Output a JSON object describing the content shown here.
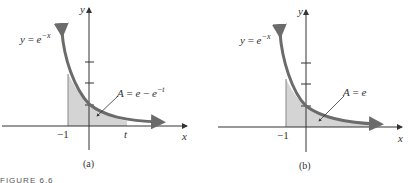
{
  "figure_caption": "FIGURE 6.6",
  "panels": [
    {
      "id": "a",
      "caption": "(a)",
      "function_label": {
        "lhs": "y",
        "eq": "=",
        "base": "e",
        "exp": "−x"
      },
      "area_label": {
        "lhs": "A",
        "eq": "=",
        "term1": "e",
        "minus": "−",
        "term2_base": "e",
        "term2_exp": "−t"
      },
      "x_axis_label": "x",
      "y_axis_label": "y",
      "x_tick_labels": [
        "−1",
        "t"
      ],
      "shaded_region": "from x = -1 to x = t under y = e^{-x}"
    },
    {
      "id": "b",
      "caption": "(b)",
      "function_label": {
        "lhs": "y",
        "eq": "=",
        "base": "e",
        "exp": "−x"
      },
      "area_label": {
        "lhs": "A",
        "eq": "=",
        "term1": "e"
      },
      "x_axis_label": "x",
      "y_axis_label": "y",
      "x_tick_labels": [
        "−1"
      ],
      "shaded_region": "from x = -1 to infinity under y = e^{-x}"
    }
  ],
  "colors": {
    "curve": "#6b6b6b",
    "shade": "#d4d4d4",
    "axis": "#333333",
    "text": "#333333"
  }
}
